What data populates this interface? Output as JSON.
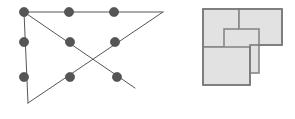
{
  "page": {
    "width": 295,
    "height": 119,
    "background_color": "#ffffff"
  },
  "colors": {
    "node_fill": "#555555",
    "node_stroke": "#444444",
    "line_stroke": "#555555",
    "tile_fill": "#e2e2e2",
    "tile_stroke": "#888888",
    "outline_stroke": "#777777"
  },
  "left_figure": {
    "name": "triangle-dot-graph",
    "caption": "",
    "stroke_width": 1,
    "node_radius": 4.6,
    "vertices": {
      "top_left": {
        "x": 24,
        "y": 12
      },
      "right": {
        "x": 163,
        "y": 12
      },
      "bottom": {
        "x": 28,
        "y": 103
      }
    },
    "nodes": [
      {
        "id": "n1",
        "label": "top-left",
        "x": 24,
        "y": 12
      },
      {
        "id": "n2",
        "label": "top-middle",
        "x": 69,
        "y": 12
      },
      {
        "id": "n3",
        "label": "top-right",
        "x": 114,
        "y": 12
      },
      {
        "id": "n4",
        "label": "mid-left",
        "x": 24,
        "y": 42
      },
      {
        "id": "n5",
        "label": "mid-middle",
        "x": 70,
        "y": 42
      },
      {
        "id": "n6",
        "label": "mid-right",
        "x": 115,
        "y": 42
      },
      {
        "id": "n7",
        "label": "low-left",
        "x": 24,
        "y": 77
      },
      {
        "id": "n8",
        "label": "low-middle",
        "x": 70,
        "y": 77
      },
      {
        "id": "n9",
        "label": "low-right",
        "x": 117,
        "y": 77
      }
    ],
    "edges": [
      {
        "id": "e-top",
        "label": "top-edge",
        "x1": 24,
        "y1": 12,
        "x2": 163,
        "y2": 12
      },
      {
        "id": "e-left",
        "label": "left-edge",
        "x1": 24,
        "y1": 12,
        "x2": 28,
        "y2": 103
      },
      {
        "id": "e-hypotenuse",
        "label": "hypotenuse",
        "x1": 163,
        "y1": 12,
        "x2": 28,
        "y2": 103
      },
      {
        "id": "e-diagonal",
        "label": "diagonal-crossing",
        "x1": 24,
        "y1": 12,
        "x2": 135,
        "y2": 88
      }
    ]
  },
  "right_figure": {
    "name": "l-shaped-tiling",
    "caption": "",
    "stroke_width": 1.6,
    "outline_points": "203,9 282,9 282,45 250,45 250,85 203,85",
    "tiles": [
      {
        "id": "t1",
        "label": "top-left-tile",
        "x": 203,
        "y": 9,
        "width": 36,
        "height": 38
      },
      {
        "id": "t2",
        "label": "top-right-tile",
        "x": 239,
        "y": 9,
        "width": 43,
        "height": 36
      },
      {
        "id": "t3",
        "label": "center-vertical-tile",
        "x": 224,
        "y": 29,
        "width": 35,
        "height": 44
      },
      {
        "id": "t4",
        "label": "bottom-left-tile",
        "x": 203,
        "y": 47,
        "width": 47,
        "height": 38
      }
    ]
  }
}
